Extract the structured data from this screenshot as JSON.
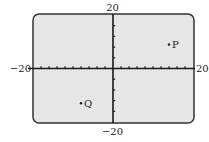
{
  "chart_data": {
    "type": "scatter",
    "title": "",
    "xlabel": "",
    "ylabel": "",
    "xlim": [
      -20,
      20
    ],
    "ylim": [
      -20,
      20
    ],
    "x_tick_step": 2,
    "y_tick_step": 4,
    "grid": false,
    "window_labels": {
      "xmin": "−20",
      "xmax": "20",
      "ymin": "−20",
      "ymax": "20"
    },
    "points": [
      {
        "label": "P",
        "x": 14,
        "y": 9
      },
      {
        "label": "Q",
        "x": -8,
        "y": -13
      }
    ]
  },
  "colors": {
    "screen_background": "#e6e6e6",
    "frame": "#333333",
    "axis": "#1a1a1a",
    "point": "#1a1a1a"
  }
}
